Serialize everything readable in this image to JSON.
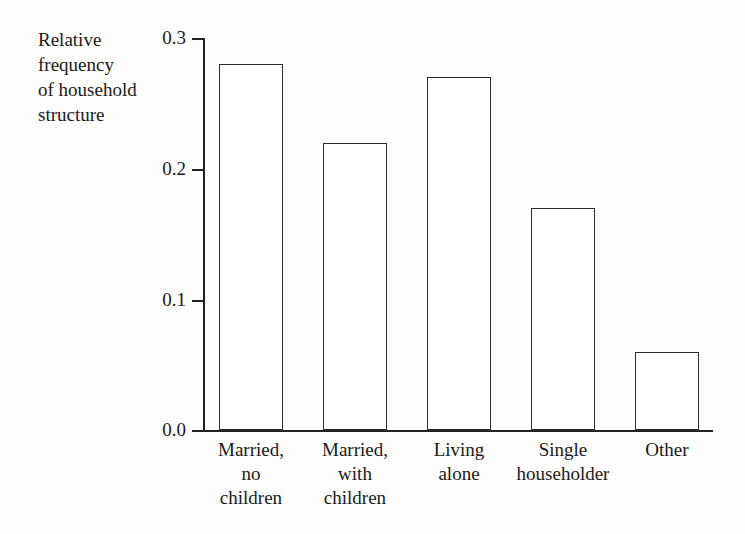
{
  "chart_data": {
    "type": "bar",
    "title": "",
    "xlabel": "",
    "ylabel": "Relative\nfrequency\nof household\nstructure",
    "categories": [
      "Married,\nno\nchildren",
      "Married,\nwith\nchildren",
      "Living\nalone",
      "Single\nhouseholder",
      "Other"
    ],
    "values": [
      0.28,
      0.22,
      0.27,
      0.17,
      0.06
    ],
    "ylim": [
      0.0,
      0.3
    ],
    "yticks": [
      0.0,
      0.1,
      0.2,
      0.3
    ],
    "ytick_labels": [
      "0.0",
      "0.1",
      "0.2",
      "0.3"
    ],
    "grid": false,
    "legend": null,
    "bar_fill_color": "#ffffff",
    "bar_edge_color": "#2b2b2b",
    "axis_color": "#222222",
    "background_color": "#fdfdfc"
  }
}
